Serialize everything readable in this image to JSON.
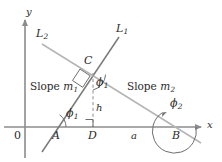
{
  "figure": {
    "colors": {
      "axis": "#8c8c8c",
      "line_l1": "#7a7a7a",
      "line_l2": "#b0b0b0",
      "helper": "#8c8c8c",
      "text": "#2b2b2b",
      "background": "#ffffff"
    },
    "axes": {
      "x_label": "x",
      "y_label": "y",
      "origin_label": "0"
    },
    "lines": [
      {
        "name": "L1",
        "label": "L",
        "subscript": "1",
        "slope_name": "m1"
      },
      {
        "name": "L2",
        "label": "L",
        "subscript": "2",
        "slope_name": "m2"
      }
    ],
    "slope_labels": [
      {
        "text": "Slope ",
        "symbol": "m",
        "subscript": "1"
      },
      {
        "text": "Slope ",
        "symbol": "m",
        "subscript": "2"
      }
    ],
    "points": [
      {
        "name": "A",
        "label": "A"
      },
      {
        "name": "B",
        "label": "B"
      },
      {
        "name": "C",
        "label": "C"
      },
      {
        "name": "D",
        "label": "D"
      }
    ],
    "angles": [
      {
        "name": "phi1-at-A",
        "symbol": "ϕ",
        "subscript": "1"
      },
      {
        "name": "phi1-at-C",
        "symbol": "ϕ",
        "subscript": "1"
      },
      {
        "name": "phi2-at-B",
        "symbol": "ϕ",
        "subscript": "2"
      }
    ],
    "segments": [
      {
        "name": "height",
        "label": "h"
      },
      {
        "name": "base",
        "label": "a"
      }
    ]
  }
}
